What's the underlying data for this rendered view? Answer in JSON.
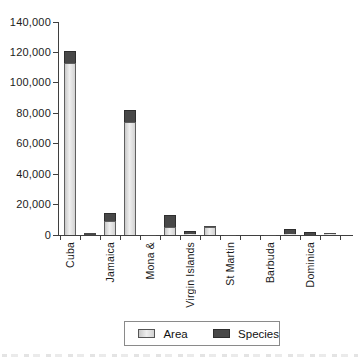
{
  "chart_data": {
    "type": "bar",
    "stacked": true,
    "title": "",
    "xlabel": "",
    "ylabel": "",
    "categories": [
      "Cuba",
      "",
      "Jamaica",
      "",
      "Mona &",
      "",
      "Virgin Islands",
      "",
      "St Martin",
      "",
      "Barbuda",
      "",
      "Dominica",
      ""
    ],
    "series": [
      {
        "name": "Area",
        "color": "#d9d9d9",
        "values": [
          113000,
          200,
          9500,
          74000,
          60,
          5500,
          800,
          5000,
          50,
          0,
          60,
          400,
          300,
          700
        ]
      },
      {
        "name": "Species",
        "color": "#484848",
        "values": [
          8000,
          1100,
          4800,
          8000,
          250,
          7800,
          2000,
          600,
          150,
          0,
          140,
          3600,
          1500,
          500
        ]
      }
    ],
    "ylim": [
      0,
      140000
    ],
    "ytick_step": 20000,
    "ytick_labels": [
      "0",
      "20,000",
      "40,000",
      "60,000",
      "80,000",
      "100,000",
      "120,000",
      "140,000"
    ],
    "grid": false,
    "legend_position": "bottom"
  },
  "legend": {
    "area_label": "Area",
    "species_label": "Species"
  },
  "colors": {
    "area_fill": "#d9d9d9",
    "species_fill": "#484848",
    "axis": "#3f3f3f"
  }
}
